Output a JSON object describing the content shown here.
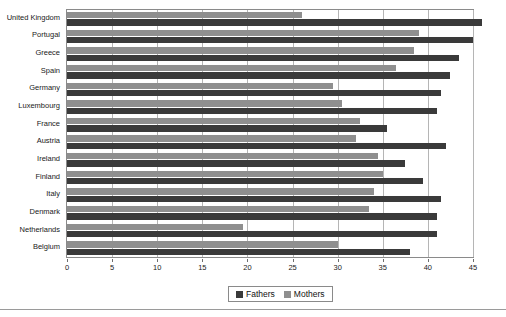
{
  "chart_data": {
    "type": "bar",
    "orientation": "horizontal",
    "title": "",
    "xlabel": "",
    "ylabel": "",
    "xlim": [
      0,
      45
    ],
    "xticks": [
      0,
      5,
      10,
      15,
      20,
      25,
      30,
      35,
      40,
      45
    ],
    "grid": true,
    "legend_position": "bottom-center",
    "categories": [
      "United Kingdom",
      "Portugal",
      "Greece",
      "Spain",
      "Germany",
      "Luxembourg",
      "France",
      "Austria",
      "Ireland",
      "Finland",
      "Italy",
      "Denmark",
      "Netherlands",
      "Belgium"
    ],
    "series": [
      {
        "name": "Fathers",
        "color": "#3a3a3a",
        "values": [
          46.0,
          45.0,
          43.5,
          42.5,
          41.5,
          41.0,
          35.5,
          42.0,
          37.5,
          39.5,
          41.5,
          41.0,
          41.0,
          38.0
        ]
      },
      {
        "name": "Mothers",
        "color": "#8f8f8f",
        "values": [
          26.0,
          39.0,
          38.5,
          36.5,
          29.5,
          30.5,
          32.5,
          32.0,
          34.5,
          35.0,
          34.0,
          33.5,
          19.5,
          30.0
        ]
      }
    ]
  },
  "legend": {
    "items": [
      {
        "label": "Fathers",
        "color": "#3a3a3a"
      },
      {
        "label": "Mothers",
        "color": "#8f8f8f"
      }
    ]
  }
}
